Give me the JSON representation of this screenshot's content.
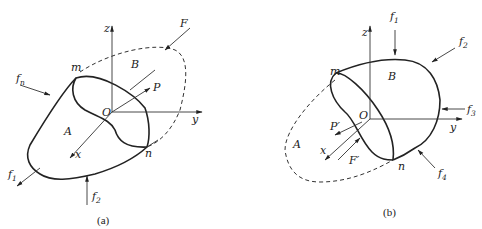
{
  "panels": [
    {
      "id": "a",
      "caption": "(a)",
      "axes": {
        "x": "x",
        "y": "y",
        "z": "z",
        "origin": "O"
      },
      "regions": {
        "solid": "A",
        "dashed": "B"
      },
      "points": {
        "top": "m",
        "bottom": "n"
      },
      "forces": {
        "F": "F",
        "P": "P",
        "fn": {
          "base": "f",
          "sub": "n"
        },
        "f1": {
          "base": "f",
          "sub": "1"
        },
        "f2": {
          "base": "f",
          "sub": "2"
        }
      }
    },
    {
      "id": "b",
      "caption": "(b)",
      "axes": {
        "x": "x",
        "y": "y",
        "z": "z",
        "origin": "O"
      },
      "regions": {
        "solid": "B",
        "dashed": "A"
      },
      "points": {
        "top": "m",
        "bottom": "n"
      },
      "forces": {
        "P_prime": "P′",
        "F_prime": "F′",
        "f1": {
          "base": "f",
          "sub": "1"
        },
        "f2": {
          "base": "f",
          "sub": "2"
        },
        "f3": {
          "base": "f",
          "sub": "3"
        },
        "f4": {
          "base": "f",
          "sub": "4"
        }
      }
    }
  ],
  "colors": {
    "line": "#222222",
    "background": "#ffffff"
  }
}
